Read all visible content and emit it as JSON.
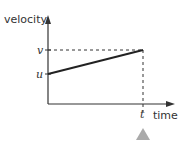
{
  "diagram": {
    "type": "velocity-time graph",
    "y_axis_label": "velocity",
    "x_axis_label": "time",
    "y_marks": [
      "v",
      "u"
    ],
    "x_marks": [
      "t"
    ],
    "line": {
      "from": "u at time 0",
      "to": "v at time t"
    },
    "colors": {
      "line": "#222222",
      "axis": "#333333",
      "marker": "#aaaaaa"
    }
  }
}
